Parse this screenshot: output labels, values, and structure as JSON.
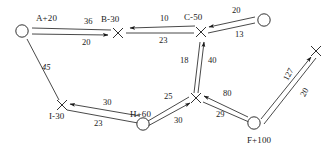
{
  "diagram": {
    "type": "network-flow-graph",
    "width": 335,
    "height": 154,
    "background_color": "#ffffff",
    "stroke_color": "#1a1a1a",
    "nodes": [
      {
        "id": "n_a",
        "label": "A+20",
        "shape": "circle",
        "x": 22,
        "y": 31,
        "label_x": 36,
        "label_y": 14
      },
      {
        "id": "n_b",
        "label": "B-30",
        "shape": "cross",
        "x": 118,
        "y": 33,
        "label_x": 103,
        "label_y": 15
      },
      {
        "id": "n_c",
        "label": "C-50",
        "shape": "cross",
        "x": 201,
        "y": 32,
        "label_x": 185,
        "label_y": 13
      },
      {
        "id": "n_topr",
        "label": "",
        "shape": "circle",
        "x": 264,
        "y": 20,
        "label_x": 0,
        "label_y": 0
      },
      {
        "id": "n_i",
        "label": "I-30",
        "shape": "cross",
        "x": 62,
        "y": 105,
        "label_x": 50,
        "label_y": 113
      },
      {
        "id": "n_h",
        "label": "H+60",
        "shape": "circle",
        "x": 143,
        "y": 124,
        "label_x": 132,
        "label_y": 110
      },
      {
        "id": "n_mid",
        "label": "",
        "shape": "cross",
        "x": 196,
        "y": 98,
        "label_x": 0,
        "label_y": 0
      },
      {
        "id": "n_f",
        "label": "F+100",
        "shape": "circle",
        "x": 254,
        "y": 123,
        "label_x": 250,
        "label_y": 139
      },
      {
        "id": "n_right",
        "label": "",
        "shape": "cross",
        "x": 316,
        "y": 51,
        "label_x": 0,
        "label_y": 0
      }
    ],
    "edges": [
      {
        "id": "e_a_b_36",
        "from": "n_a",
        "to": "n_b",
        "weight": "36",
        "arrow": "none",
        "label_x": 84,
        "label_y": 19
      },
      {
        "id": "e_a_b_20",
        "from": "n_a",
        "to": "n_b",
        "weight": "20",
        "arrow": "to",
        "label_x": 82,
        "label_y": 39
      },
      {
        "id": "e_c_b_10",
        "from": "n_c",
        "to": "n_b",
        "weight": "10",
        "arrow": "to",
        "label_x": 162,
        "label_y": 18
      },
      {
        "id": "e_b_c_23",
        "from": "n_b",
        "to": "n_c",
        "weight": "23",
        "arrow": "none",
        "label_x": 162,
        "label_y": 38
      },
      {
        "id": "e_tr_c_20",
        "from": "n_topr",
        "to": "n_c",
        "weight": "20",
        "arrow": "to",
        "label_x": 233,
        "label_y": 10
      },
      {
        "id": "e_c_tr_13",
        "from": "n_c",
        "to": "n_topr",
        "weight": "13",
        "arrow": "none",
        "label_x": 236,
        "label_y": 33
      },
      {
        "id": "e_a_i_45",
        "from": "n_a",
        "to": "n_i",
        "weight": "45",
        "arrow": "none",
        "label_x": 44,
        "label_y": 66
      },
      {
        "id": "e_mid_c_18",
        "from": "n_mid",
        "to": "n_c",
        "weight": "18",
        "arrow": "none",
        "label_x": 187,
        "label_y": 58
      },
      {
        "id": "e_mid_c_40",
        "from": "n_mid",
        "to": "n_c",
        "weight": "40",
        "arrow": "to",
        "label_x": 208,
        "label_y": 58
      },
      {
        "id": "e_h_i_30",
        "from": "n_h",
        "to": "n_i",
        "weight": "30",
        "arrow": "to",
        "label_x": 104,
        "label_y": 101
      },
      {
        "id": "e_i_h_23",
        "from": "n_i",
        "to": "n_h",
        "weight": "23",
        "arrow": "none",
        "label_x": 95,
        "label_y": 121
      },
      {
        "id": "e_mid_h_25",
        "from": "n_mid",
        "to": "n_h",
        "weight": "25",
        "arrow": "none",
        "label_x": 166,
        "label_y": 95
      },
      {
        "id": "e_h_mid_30",
        "from": "n_h",
        "to": "n_mid",
        "weight": "30",
        "arrow": "to",
        "label_x": 175,
        "label_y": 117
      },
      {
        "id": "e_f_mid_80",
        "from": "n_f",
        "to": "n_mid",
        "weight": "80",
        "arrow": "to",
        "label_x": 224,
        "label_y": 92
      },
      {
        "id": "e_mid_f_29",
        "from": "n_mid",
        "to": "n_f",
        "weight": "29",
        "arrow": "none",
        "label_x": 218,
        "label_y": 113
      },
      {
        "id": "e_f_r_127",
        "from": "n_f",
        "to": "n_right",
        "weight": "127",
        "arrow": "to",
        "label_x": 285,
        "label_y": 73
      },
      {
        "id": "e_r_f_20",
        "from": "n_right",
        "to": "n_f",
        "weight": "20",
        "arrow": "none",
        "label_x": 301,
        "label_y": 90
      }
    ]
  }
}
